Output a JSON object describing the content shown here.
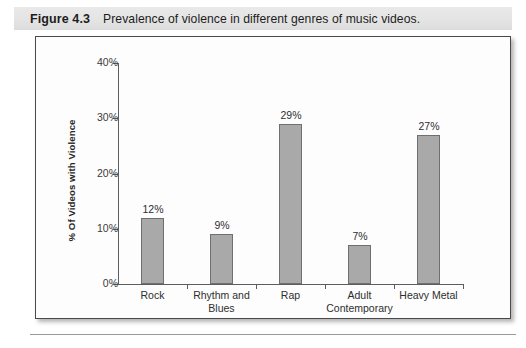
{
  "caption": {
    "number": "Figure 4.3",
    "text": "Prevalence of violence in different genres of music videos."
  },
  "chart_data": {
    "type": "bar",
    "title": "",
    "xlabel": "",
    "ylabel": "% Of Videos with Violence",
    "categories": [
      "Rock",
      "Rhythm and Blues",
      "Rap",
      "Adult Contemporary",
      "Heavy Metal"
    ],
    "values": [
      12,
      9,
      29,
      7,
      27
    ],
    "data_labels": [
      "12%",
      "9%",
      "29%",
      "7%",
      "27%"
    ],
    "ylim": [
      0,
      40
    ],
    "ytick_values": [
      0,
      10,
      20,
      30,
      40
    ],
    "ytick_labels": [
      "0%",
      "10%",
      "20%",
      "30%",
      "40%"
    ],
    "grid": false,
    "legend": false,
    "bar_color": "#a9a9a9",
    "bar_border_color": "#6f6f6f",
    "axis_color": "#5d5d5d"
  }
}
